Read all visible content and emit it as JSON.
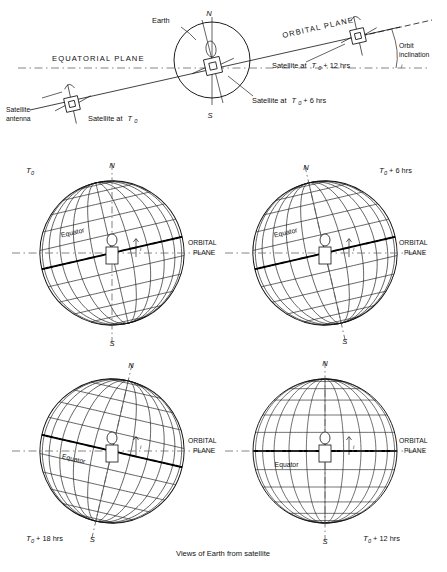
{
  "figure": {
    "caption": "Views of Earth from satellite"
  },
  "top_diagram": {
    "labels": {
      "earth": "Earth",
      "equatorial_plane": "EQUATORIAL PLANE",
      "orbital_plane": "ORBITAL PLANE",
      "orbit_inclination_line1": "Orbit",
      "orbit_inclination_line2": "inclination",
      "satellite_antenna_line1": "Satellite",
      "satellite_antenna_line2": "antenna",
      "satellite_t0": "Satellite at",
      "satellite_t0_sym": "T",
      "satellite_t0_sub": "0",
      "satellite_t6": "Satellite at",
      "satellite_t6_sym": "T",
      "satellite_t6_sub": "0",
      "satellite_t6_rest": " + 6 hrs",
      "satellite_t12": "Satellite at",
      "satellite_t12_sym": "T",
      "satellite_t12_sub": "0",
      "satellite_t12_rest": " + 12 hrs",
      "pole_north": "N",
      "pole_south": "S",
      "inclination_symbol": "i"
    }
  },
  "globes": [
    {
      "id": "globe-t0",
      "time_sym": "T",
      "time_sub": "0",
      "time_rest": "",
      "time_label_pos": "top-left",
      "equator_label": "Equator",
      "pole_north": "N",
      "pole_south": "S",
      "inclination_symbol": "i",
      "tilt_deg": -13,
      "equator_offset": -11,
      "axis_tilt_deg": 0
    },
    {
      "id": "globe-t0-plus-6",
      "time_sym": "T",
      "time_sub": "0",
      "time_rest": " + 6 hrs",
      "time_label_pos": "top-right",
      "equator_label": "Equator",
      "pole_north": "N",
      "pole_south": "S",
      "inclination_symbol": "i",
      "tilt_deg": -13,
      "equator_offset": 0,
      "axis_tilt_deg": -13
    },
    {
      "id": "globe-t0-plus-18",
      "time_sym": "T",
      "time_sub": "0",
      "time_rest": " + 18 hrs",
      "time_label_pos": "bottom-left",
      "equator_label": "Equator",
      "pole_north": "N",
      "pole_south": "S",
      "inclination_symbol": "i",
      "tilt_deg": 13,
      "equator_offset": 0,
      "axis_tilt_deg": 13
    },
    {
      "id": "globe-t0-plus-12",
      "time_sym": "T",
      "time_sub": "0",
      "time_rest": " + 12 hrs",
      "time_label_pos": "bottom-right",
      "equator_label": "Equator",
      "pole_north": "N",
      "pole_south": "S",
      "inclination_symbol": "i",
      "tilt_deg": 0,
      "equator_offset": 14,
      "axis_tilt_deg": 0
    }
  ],
  "plane_labels": {
    "orbital_line1": "ORBITAL",
    "orbital_line2": "PLANE"
  },
  "colors": {
    "ink": "#111111",
    "grid": "#1a1a1a",
    "plane_dash": "#666666",
    "background": "#ffffff"
  }
}
